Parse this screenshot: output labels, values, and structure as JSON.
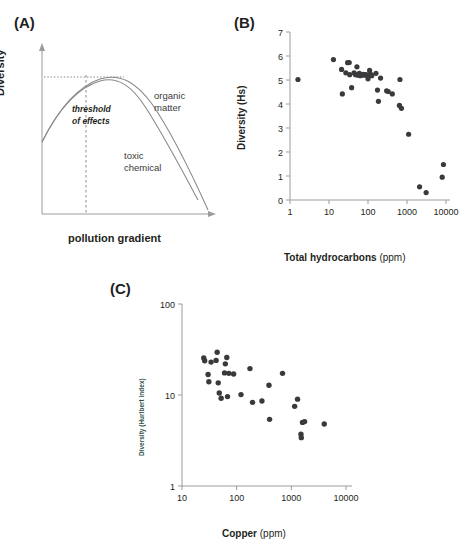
{
  "figure": {
    "panels": [
      {
        "id": "A",
        "label": "(A)"
      },
      {
        "id": "B",
        "label": "(B)"
      },
      {
        "id": "C",
        "label": "(C)"
      }
    ],
    "colors": {
      "dot": "#3a3a3c",
      "axis": "#9b9b9b",
      "curve": "#8a8a8a",
      "text": "#231f20",
      "panelc_ylabel": "#2f4f45"
    }
  },
  "panel_a": {
    "label": "(A)",
    "xlabel": "pollution gradient",
    "ylabel": "Diversity",
    "annotations": {
      "threshold_line1": "threshold",
      "threshold_line2": "of effects",
      "organic_line1": "organic",
      "organic_line2": "matter",
      "toxic_line1": "toxic",
      "toxic_line2": "chemical"
    }
  },
  "chart_data": [
    {
      "panel": "A",
      "type": "line",
      "title": "",
      "xlabel": "pollution gradient",
      "ylabel": "Diversity",
      "grid": false,
      "axis_ticks": false,
      "annotations": [
        "threshold of effects",
        "organic matter",
        "toxic chemical"
      ],
      "series": [
        {
          "name": "organic matter",
          "comment": "rises from moderate start, broad hump, peaks slightly right of threshold then declines",
          "x": [
            0,
            0.08,
            0.18,
            0.3,
            0.42,
            0.5,
            0.58,
            0.68,
            0.78,
            0.88,
            1.0
          ],
          "y": [
            0.47,
            0.62,
            0.76,
            0.86,
            0.91,
            0.91,
            0.88,
            0.78,
            0.62,
            0.4,
            0.1
          ]
        },
        {
          "name": "toxic chemical",
          "comment": "same rise but declines faster after the peak",
          "x": [
            0,
            0.08,
            0.18,
            0.3,
            0.42,
            0.5,
            0.58,
            0.68,
            0.78,
            0.88,
            1.0
          ],
          "y": [
            0.47,
            0.62,
            0.76,
            0.86,
            0.9,
            0.89,
            0.84,
            0.72,
            0.55,
            0.32,
            0.02
          ]
        }
      ],
      "reference_lines": [
        {
          "name": "threshold of effects",
          "orientation": "vertical",
          "x": 0.3,
          "style": "dashed"
        },
        {
          "name": "peak diversity level",
          "orientation": "horizontal",
          "y": 0.9,
          "style": "dotted"
        }
      ]
    },
    {
      "panel": "B",
      "type": "scatter",
      "title": "",
      "xlabel": "Total hydrocarbons (ppm)",
      "ylabel": "Diversity (Hs)",
      "xscale": "log",
      "yscale": "linear",
      "xlim": [
        1,
        10000
      ],
      "ylim": [
        0,
        7
      ],
      "xticks": [
        1,
        10,
        100,
        1000,
        10000
      ],
      "yticks": [
        0,
        1,
        2,
        3,
        4,
        5,
        6,
        7
      ],
      "xticklabels": [
        "1",
        "10",
        "100",
        "1000",
        "10000"
      ],
      "yticklabels": [
        "0",
        "1",
        "2",
        "3",
        "4",
        "5",
        "6",
        "7"
      ],
      "grid": false,
      "legend": "none",
      "points": [
        [
          1.6,
          5.02
        ],
        [
          13,
          5.85
        ],
        [
          21,
          5.44
        ],
        [
          22,
          4.42
        ],
        [
          27,
          5.3
        ],
        [
          30,
          5.72
        ],
        [
          33,
          5.73
        ],
        [
          34,
          5.22
        ],
        [
          38,
          4.68
        ],
        [
          44,
          5.3
        ],
        [
          48,
          5.22
        ],
        [
          52,
          5.55
        ],
        [
          55,
          5.2
        ],
        [
          60,
          5.28
        ],
        [
          64,
          5.18
        ],
        [
          70,
          5.22
        ],
        [
          75,
          5.24
        ],
        [
          80,
          5.2
        ],
        [
          88,
          5.22
        ],
        [
          95,
          5.2
        ],
        [
          100,
          5.05
        ],
        [
          110,
          5.4
        ],
        [
          120,
          5.22
        ],
        [
          125,
          5.18
        ],
        [
          160,
          5.28
        ],
        [
          175,
          4.58
        ],
        [
          185,
          4.11
        ],
        [
          210,
          5.08
        ],
        [
          300,
          4.55
        ],
        [
          330,
          4.52
        ],
        [
          420,
          4.42
        ],
        [
          640,
          3.94
        ],
        [
          660,
          5.02
        ],
        [
          720,
          3.82
        ],
        [
          1100,
          2.74
        ],
        [
          2100,
          0.55
        ],
        [
          3100,
          0.31
        ],
        [
          8000,
          0.95
        ],
        [
          8600,
          1.48
        ]
      ]
    },
    {
      "panel": "C",
      "type": "scatter",
      "title": "",
      "xlabel": "Copper (ppm)",
      "ylabel": "Diversity (Hurlbert index)",
      "xscale": "log",
      "yscale": "log",
      "xlim": [
        10,
        10000
      ],
      "ylim": [
        1,
        100
      ],
      "xticks": [
        10,
        100,
        1000,
        10000
      ],
      "yticks": [
        1,
        10,
        100
      ],
      "xticklabels": [
        "10",
        "100",
        "1000",
        "10000"
      ],
      "yticklabels": [
        "1",
        "10",
        "100"
      ],
      "grid": false,
      "legend": "none",
      "points": [
        [
          25,
          25.5
        ],
        [
          26,
          23.8
        ],
        [
          30,
          16.8
        ],
        [
          31,
          14.0
        ],
        [
          34,
          23.0
        ],
        [
          42,
          24.0
        ],
        [
          44,
          29.5
        ],
        [
          46,
          13.6
        ],
        [
          48,
          10.5
        ],
        [
          52,
          9.2
        ],
        [
          60,
          17.5
        ],
        [
          62,
          22.0
        ],
        [
          66,
          25.8
        ],
        [
          68,
          9.6
        ],
        [
          72,
          17.3
        ],
        [
          88,
          17.0
        ],
        [
          120,
          10.1
        ],
        [
          175,
          19.5
        ],
        [
          195,
          8.3
        ],
        [
          290,
          8.6
        ],
        [
          390,
          12.8
        ],
        [
          400,
          5.4
        ],
        [
          690,
          17.3
        ],
        [
          1150,
          7.5
        ],
        [
          1300,
          9.0
        ],
        [
          1500,
          3.7
        ],
        [
          1520,
          3.4
        ],
        [
          1600,
          5.0
        ],
        [
          1750,
          5.1
        ],
        [
          4000,
          4.8
        ]
      ]
    }
  ]
}
